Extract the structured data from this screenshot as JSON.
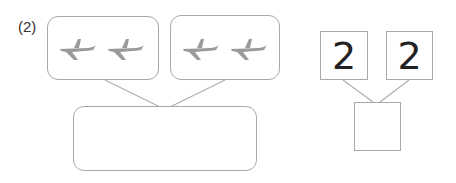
{
  "problem": {
    "label": "(2)"
  },
  "left_diagram": {
    "groups": [
      {
        "icon": "airplane-icon",
        "count": 2
      },
      {
        "icon": "airplane-icon",
        "count": 2
      }
    ],
    "total": ""
  },
  "right_diagram": {
    "parts": [
      "2",
      "2"
    ],
    "total": ""
  },
  "colors": {
    "border": "#a9a9a9",
    "plane": "#9a9a9a",
    "text": "#222222"
  }
}
